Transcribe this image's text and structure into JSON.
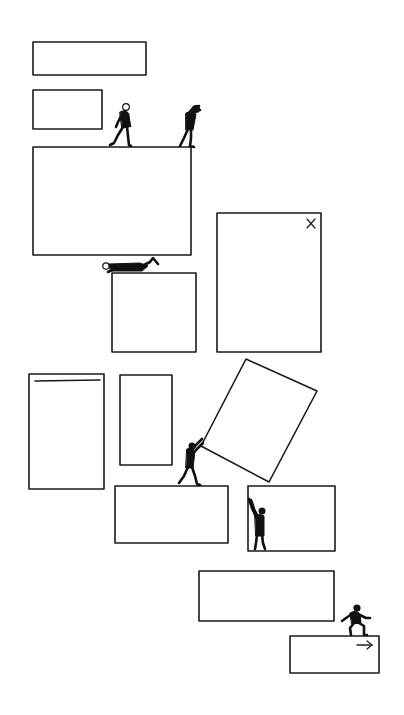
{
  "illustration": {
    "title": "Figures moving rectangular window panels",
    "colors": {
      "ink": "#1a1a1a",
      "background": "#ffffff"
    },
    "panels": [
      {
        "id": "top-wide-bar",
        "icon": null
      },
      {
        "id": "small-box",
        "icon": null
      },
      {
        "id": "large-platform",
        "icon": null
      },
      {
        "id": "tall-box-close",
        "icon": "close-icon"
      },
      {
        "id": "lower-box-under-crawler",
        "icon": null
      },
      {
        "id": "tall-left-with-header",
        "icon": "header-line"
      },
      {
        "id": "narrow-tall",
        "icon": null
      },
      {
        "id": "tilted-panel",
        "icon": null
      },
      {
        "id": "pushed-base",
        "icon": null
      },
      {
        "id": "holding-box",
        "icon": null
      },
      {
        "id": "wide-lower",
        "icon": null
      },
      {
        "id": "small-next",
        "icon": "arrow-right-icon"
      }
    ],
    "figures": [
      "walking-person",
      "person-looking",
      "crawling-person",
      "pushing-person",
      "holding-person",
      "climbing-person"
    ]
  }
}
